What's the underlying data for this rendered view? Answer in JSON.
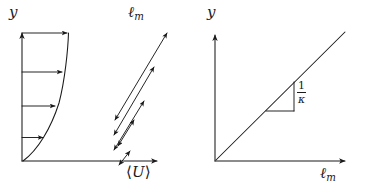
{
  "figure": {
    "type": "two-panel-schematic",
    "background_color": "#ffffff",
    "ink_color": "#1a1a1a"
  },
  "left_panel": {
    "name": "mean-velocity-profile-panel",
    "y_axis_label": "y",
    "x_axis_label_prefix": "⟨",
    "x_axis_label_symbol": "U",
    "x_axis_label_suffix": "⟩",
    "x_axis_label": "⟨U⟩",
    "mixing_length_label_symbol": "ℓ",
    "mixing_length_label_subscript": "m",
    "mixing_length_label": "ℓm",
    "axes": {
      "origin": [
        22,
        161
      ],
      "y_axis_top": [
        22,
        30
      ],
      "x_axis_right": [
        160,
        161
      ],
      "arrowheads": [
        "y-top",
        "x-right"
      ]
    },
    "profile_curve": {
      "description": "concave mean velocity profile rising from origin",
      "points": [
        [
          23,
          161
        ],
        [
          34,
          140
        ],
        [
          45,
          117
        ],
        [
          54,
          92
        ],
        [
          61,
          66
        ],
        [
          66,
          44
        ],
        [
          68,
          33
        ]
      ]
    },
    "velocity_arrows": [
      {
        "index": 1,
        "y": 137,
        "x_start": 22,
        "x_end": 45,
        "length": 23
      },
      {
        "index": 2,
        "y": 106,
        "x_start": 22,
        "x_end": 57,
        "length": 35
      },
      {
        "index": 3,
        "y": 72,
        "x_start": 22,
        "x_end": 64,
        "length": 42
      },
      {
        "index": 4,
        "y": 33,
        "x_start": 22,
        "x_end": 69,
        "length": 47
      }
    ],
    "mixing_length_arrows": [
      {
        "index": 1,
        "x1": 114,
        "y1": 121,
        "x2": 168,
        "y2": 32,
        "double_headed": true
      },
      {
        "index": 2,
        "x1": 113,
        "y1": 136,
        "x2": 155,
        "y2": 66,
        "double_headed": true
      },
      {
        "index": 3,
        "x1": 113,
        "y1": 151,
        "x2": 145,
        "y2": 100,
        "double_headed": true
      },
      {
        "index": 4,
        "x1": 117,
        "y1": 147,
        "x2": 135,
        "y2": 119,
        "double_headed": true
      },
      {
        "index": 5,
        "x1": 118,
        "y1": 166,
        "x2": 130,
        "y2": 150,
        "double_headed": true
      }
    ]
  },
  "right_panel": {
    "name": "mixing-length-vs-y-panel",
    "y_axis_label": "y",
    "x_axis_label_symbol": "ℓ",
    "x_axis_label_subscript": "m",
    "x_axis_label": "ℓm",
    "axes": {
      "origin": [
        215,
        161
      ],
      "y_axis_top": [
        215,
        32
      ],
      "x_axis_right": [
        348,
        161
      ],
      "arrowheads": [
        "y-top",
        "x-right"
      ]
    },
    "line": {
      "description": "straight line through origin with slope 1/kappa",
      "start": [
        216,
        160
      ],
      "end": [
        345,
        32
      ],
      "slope_label_numerator": "1",
      "slope_label_denominator": "κ",
      "slope_label": "1/κ"
    },
    "slope_triangle": {
      "description": "right triangle indicating slope, hypotenuse on the line",
      "vertices": [
        [
          266,
          111
        ],
        [
          294,
          111
        ],
        [
          294,
          82
        ]
      ],
      "legs": [
        "horizontal-bottom",
        "vertical-right"
      ]
    },
    "slope_annotation": {
      "numerator": "1",
      "denominator": "κ",
      "position": [
        297,
        80
      ]
    }
  }
}
